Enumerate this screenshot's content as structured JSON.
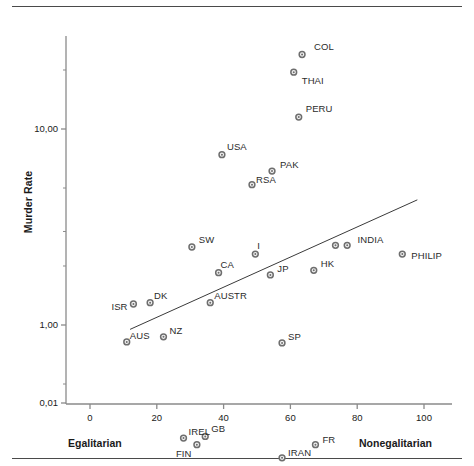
{
  "chart_data": {
    "type": "scatter",
    "title": "",
    "xlabel": "",
    "ylabel": "Murder Rate",
    "xlim": [
      -4,
      106
    ],
    "ylim_log": [
      0.01,
      40
    ],
    "y_scale": "log",
    "grid": false,
    "legend": "none",
    "xticks": [
      "0",
      "20",
      "40",
      "60",
      "80",
      "100"
    ],
    "xtick_values": [
      0,
      20,
      40,
      60,
      80,
      100
    ],
    "yticks": [
      "10,00",
      "1,00",
      "0,10",
      "0,01"
    ],
    "ytick_values": [
      10.0,
      1.0,
      0.1,
      0.01
    ],
    "x_axis_left_annotation": "Egalitarian",
    "x_axis_right_annotation": "Nonegalitarian",
    "marker_color": "#6e6e6e",
    "trendline_color": "#3a3a3a",
    "axis_color": "#8a8a8a",
    "points": [
      {
        "label": "COL",
        "x": 63.5,
        "y": 24.0,
        "lx": 12,
        "ly": -13
      },
      {
        "label": "THAI",
        "x": 61.0,
        "y": 19.5,
        "lx": 8,
        "ly": 3
      },
      {
        "label": "PERU",
        "x": 62.5,
        "y": 11.5,
        "lx": 7,
        "ly": -14
      },
      {
        "label": "USA",
        "x": 39.5,
        "y": 7.4,
        "lx": 5,
        "ly": -14
      },
      {
        "label": "PAK",
        "x": 54.5,
        "y": 6.1,
        "lx": 8,
        "ly": -12
      },
      {
        "label": "RSA",
        "x": 48.5,
        "y": 5.2,
        "lx": 4,
        "ly": -11
      },
      {
        "label": "INDIA",
        "x": 73.5,
        "y": 2.55,
        "lx": 22,
        "ly": -11
      },
      {
        "label": "",
        "x": 77.0,
        "y": 2.55,
        "lx": 0,
        "ly": 0
      },
      {
        "label": "PHILIP",
        "x": 93.5,
        "y": 2.3,
        "lx": 9,
        "ly": -4
      },
      {
        "label": "SW",
        "x": 30.5,
        "y": 2.5,
        "lx": 7,
        "ly": -13
      },
      {
        "label": "I",
        "x": 49.5,
        "y": 2.3,
        "lx": 2,
        "ly": -14
      },
      {
        "label": "CA",
        "x": 38.5,
        "y": 1.85,
        "lx": 2,
        "ly": -14
      },
      {
        "label": "JP",
        "x": 54.0,
        "y": 1.8,
        "lx": 7,
        "ly": -12
      },
      {
        "label": "HK",
        "x": 67.0,
        "y": 1.9,
        "lx": 7,
        "ly": -12
      },
      {
        "label": "ISR",
        "x": 13.0,
        "y": 1.28,
        "lx": -22,
        "ly": -3
      },
      {
        "label": "DK",
        "x": 18.0,
        "y": 1.3,
        "lx": 4,
        "ly": -13
      },
      {
        "label": "AUSTR",
        "x": 36.0,
        "y": 1.3,
        "lx": 4,
        "ly": -13
      },
      {
        "label": "AUS",
        "x": 11.0,
        "y": 0.82,
        "lx": 3,
        "ly": -12
      },
      {
        "label": "NZ",
        "x": 22.0,
        "y": 0.87,
        "lx": 6,
        "ly": -12
      },
      {
        "label": "SP",
        "x": 57.5,
        "y": 0.81,
        "lx": 6,
        "ly": -12
      },
      {
        "label": "IREL",
        "x": 28.0,
        "y": 0.265,
        "lx": 5,
        "ly": -12
      },
      {
        "label": "GB",
        "x": 34.5,
        "y": 0.27,
        "lx": 6,
        "ly": -13
      },
      {
        "label": "FIN",
        "x": 32.0,
        "y": 0.245,
        "lx": -21,
        "ly": 3
      },
      {
        "label": "NOR",
        "x": 32.5,
        "y": 0.175,
        "lx": 4,
        "ly": 9
      },
      {
        "label": "IRAN",
        "x": 57.5,
        "y": 0.21,
        "lx": 6,
        "ly": -11
      },
      {
        "label": "FR",
        "x": 67.5,
        "y": 0.245,
        "lx": 7,
        "ly": -11
      }
    ],
    "trendline": {
      "x0": 12.0,
      "y0": 0.95,
      "x1": 98.0,
      "y1": 4.35
    }
  }
}
